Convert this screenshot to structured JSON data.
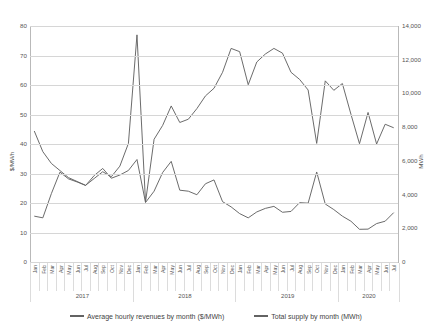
{
  "chart_data": {
    "type": "line",
    "title": "",
    "xlabel": "",
    "ylabel": "$/MWh",
    "y2label": "MWh",
    "ylim": [
      0,
      80
    ],
    "y2lim": [
      0,
      14000
    ],
    "grid": true,
    "legend_position": "bottom",
    "y_ticks": [
      "0",
      "10",
      "20",
      "30",
      "40",
      "50",
      "60",
      "70",
      "80"
    ],
    "y_tick_values": [
      0,
      10,
      20,
      30,
      40,
      50,
      60,
      70,
      80
    ],
    "y2_ticks": [
      "0",
      "2,000",
      "4,000",
      "6,000",
      "8,000",
      "10,000",
      "12,000",
      "14,000"
    ],
    "y2_tick_values": [
      0,
      2000,
      4000,
      6000,
      8000,
      10000,
      12000,
      14000
    ],
    "months": [
      "Jan",
      "Feb",
      "Mar",
      "Apr",
      "May",
      "Jun",
      "Jul",
      "Aug",
      "Sep",
      "Oct",
      "Nov",
      "Dec",
      "Jan",
      "Feb",
      "Mar",
      "Apr",
      "May",
      "Jun",
      "Jul",
      "Aug",
      "Sep",
      "Oct",
      "Nov",
      "Dec",
      "Jan",
      "Feb",
      "Mar",
      "Apr",
      "May",
      "Jun",
      "Jul",
      "Aug",
      "Sep",
      "Oct",
      "Nov",
      "Dec",
      "Jan",
      "Feb",
      "Mar",
      "Apr",
      "May",
      "Jun",
      "Jul"
    ],
    "year_groups": [
      {
        "label": "2017",
        "count": 12
      },
      {
        "label": "2018",
        "count": 12
      },
      {
        "label": "2019",
        "count": 12
      },
      {
        "label": "2020",
        "count": 7
      }
    ],
    "series": [
      {
        "name": "Average hourly revenues by month ($/MWh)",
        "axis": "left",
        "unit": "$/MWh",
        "color": "#636363",
        "values": [
          44.4,
          37.4,
          33.4,
          31.0,
          28.6,
          27.3,
          26.0,
          28.3,
          30.6,
          28.9,
          32.5,
          40.2,
          77.0,
          20.3,
          41.6,
          46.3,
          52.9,
          47.3,
          48.4,
          52.0,
          56.3,
          58.9,
          64.3,
          72.4,
          71.3,
          60.1,
          67.8,
          70.5,
          72.4,
          70.8,
          64.3,
          61.9,
          58.3,
          40.2,
          61.4,
          58.2,
          60.5,
          50.1,
          40.1,
          50.7,
          40.0,
          46.7,
          45.5
        ]
      },
      {
        "name": "Total supply by month (MWh)",
        "axis": "right",
        "unit": "MWh",
        "color": "#636363",
        "values": [
          2720,
          2620,
          4060,
          5330,
          4930,
          4750,
          4540,
          5130,
          5550,
          4970,
          5160,
          5430,
          6080,
          3530,
          4200,
          5310,
          5970,
          4260,
          4200,
          3990,
          4640,
          4870,
          3580,
          3270,
          2870,
          2620,
          2970,
          3180,
          3300,
          2950,
          3000,
          3520,
          3490,
          5340,
          3440,
          3110,
          2720,
          2420,
          1940,
          1950,
          2280,
          2420,
          2930
        ]
      }
    ]
  },
  "legend": {
    "items": [
      {
        "label": "Average hourly revenues by month ($/MWh)"
      },
      {
        "label": "Total supply by month (MWh)"
      }
    ]
  }
}
